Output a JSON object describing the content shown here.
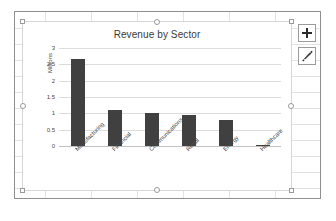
{
  "app": {
    "context": "excel-worksheet",
    "chart_selected": true
  },
  "chart_buttons": [
    {
      "name": "chart-elements-button",
      "icon": "plus-icon",
      "label": "+"
    },
    {
      "name": "chart-styles-button",
      "icon": "paintbrush-icon",
      "label": "Chart Styles"
    }
  ],
  "colors": {
    "bar": "#404040",
    "gridline": "#dcdcdc",
    "axis": "#c2c2c2",
    "chart_border": "#d6d6d6",
    "sheet_border": "#8f8f8f",
    "text": "#4a4a4a",
    "title_text": "#3a3a3a",
    "handle_fill": "#ffffff",
    "handle_border": "#9a9a9a"
  },
  "selection_handles": [
    "top-left",
    "top-center",
    "top-right",
    "middle-left",
    "middle-right",
    "bottom-left",
    "bottom-center",
    "bottom-right"
  ],
  "chart_data": {
    "type": "bar",
    "title": "Revenue by Sector",
    "xlabel": "",
    "ylabel": "Millions",
    "categories": [
      "Manufacturing",
      "Financial",
      "Communications",
      "Retail",
      "Energy",
      "Healthcare"
    ],
    "values": [
      2.65,
      1.1,
      1.0,
      0.95,
      0.8,
      0.03
    ],
    "series": [
      {
        "name": "Revenue",
        "values": [
          2.65,
          1.1,
          1.0,
          0.95,
          0.8,
          0.03
        ]
      }
    ],
    "ylim": [
      0,
      3
    ],
    "ytick_values": [
      0,
      0.5,
      1,
      1.5,
      2,
      2.5,
      3
    ],
    "ytick_labels": [
      "0",
      "0.5",
      "1",
      "1.5",
      "2",
      "2.5",
      "3"
    ],
    "grid": true,
    "grid_axis": "y",
    "legend": false,
    "legend_position": "none",
    "xlabel_rotation": -45,
    "ylabel_rotation": -90
  }
}
